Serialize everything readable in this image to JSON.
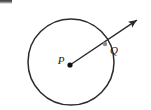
{
  "figure": {
    "type": "geometry-diagram",
    "canvas": {
      "width": 151,
      "height": 110,
      "background_color": "#ffffff"
    },
    "stroke_color": "#2b2b2b",
    "label_color": "#1a1a1a",
    "marker_color": "#111111",
    "q_marker_color": "#8c8c8c",
    "circle": {
      "name": "circle",
      "center_x": 71,
      "center_y": 62,
      "radius": 43,
      "stroke_width": 1.5,
      "fill": "none"
    },
    "points": [
      {
        "id": "P",
        "label": "P",
        "role": "center",
        "x": 70,
        "y": 65,
        "label_x": 61,
        "label_y": 61,
        "marker_radius": 2.6
      },
      {
        "id": "Q",
        "label": "Q",
        "role": "on-circle",
        "x": 105,
        "y": 44,
        "label_x": 114,
        "label_y": 51,
        "marker_radius": 2.2
      }
    ],
    "ray": {
      "name": "ray-PQ",
      "from_x": 70,
      "from_y": 65,
      "through_x": 105,
      "through_y": 44,
      "tip_x": 143,
      "tip_y": 16,
      "stroke_width": 1.4,
      "arrowhead": true
    },
    "artifact": {
      "name": "scan-smudge",
      "x": 0,
      "y": 0,
      "width": 12,
      "height": 4
    }
  },
  "chart_data": {
    "type": "scatter",
    "title": "",
    "xlabel": "",
    "ylabel": "",
    "annotations": [
      "P",
      "Q"
    ],
    "shapes": [
      {
        "kind": "circle",
        "cx": 71,
        "cy": 62,
        "r": 43
      },
      {
        "kind": "ray",
        "x1": 70,
        "y1": 65,
        "x2": 143,
        "y2": 16
      }
    ],
    "points": [
      {
        "label": "P",
        "x": 70,
        "y": 65
      },
      {
        "label": "Q",
        "x": 105,
        "y": 44
      }
    ]
  }
}
